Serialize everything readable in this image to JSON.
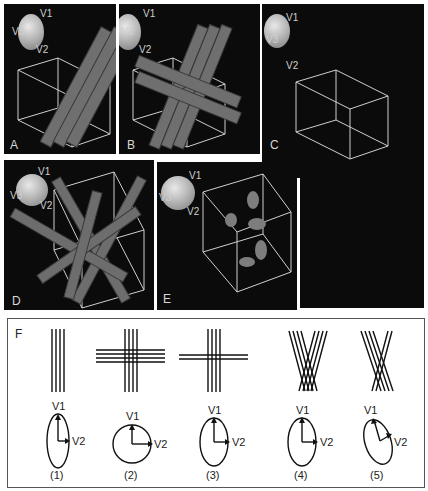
{
  "figure": {
    "panels": [
      {
        "id": "A",
        "label": "A",
        "description": "Parallel bundle of cylinders tilted through cube"
      },
      {
        "id": "B",
        "label": "B",
        "description": "Tilted bundle crossed by two horizontal cylinders"
      },
      {
        "id": "C",
        "label": "C",
        "description": "Empty cube with isotropic ellipsoid"
      },
      {
        "id": "D",
        "label": "D",
        "description": "Randomly oriented cylinders in cube"
      },
      {
        "id": "E",
        "label": "E",
        "description": "Isolated ellipsoidal blobs in cube"
      },
      {
        "id": "F",
        "label": "F",
        "description": "Schematic of fiber configurations and tensor eigenvectors"
      }
    ],
    "axes_labels": {
      "v1": "V1",
      "v2": "V2",
      "v3": "V3"
    },
    "schematics": [
      {
        "index": "(1)",
        "config": "parallel vertical lines",
        "v1": "V1",
        "v2": "V2",
        "shape": "elongated ellipse"
      },
      {
        "index": "(2)",
        "config": "equal vertical and horizontal crossing",
        "v1": "V1",
        "v2": "V2",
        "shape": "circle"
      },
      {
        "index": "(3)",
        "config": "vertical bundle crossed by thinner horizontal",
        "v1": "V1",
        "v2": "V2",
        "shape": "ellipse"
      },
      {
        "index": "(4)",
        "config": "fanning crossing bundles",
        "v1": "V1",
        "v2": "V2",
        "shape": "ellipse"
      },
      {
        "index": "(5)",
        "config": "asymmetric crossing bundles",
        "v1": "V1",
        "v2": "V2",
        "shape": "tilted ellipse"
      }
    ]
  }
}
